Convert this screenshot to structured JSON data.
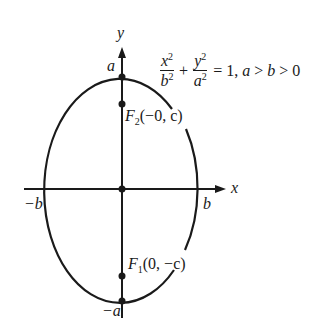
{
  "diagram": {
    "type": "ellipse-vertical-major-axis",
    "equation": {
      "term1_num": "x",
      "term1_den": "b",
      "term2_num": "y",
      "term2_den": "a",
      "exp": "2",
      "rhs": "= 1,",
      "condition_a": "a",
      "gt1": " > ",
      "condition_b": "b",
      "gt2": " > 0"
    },
    "axes": {
      "x_label": "x",
      "y_label": "y"
    },
    "vertices": {
      "top": "a",
      "bottom": "−a",
      "left": "−b",
      "right": "b"
    },
    "foci": [
      {
        "name": "F",
        "sub": "2",
        "coords": "(−0, c)"
      },
      {
        "name": "F",
        "sub": "1",
        "coords": "(0, −c)"
      }
    ],
    "colors": {
      "stroke": "#1a1a1a",
      "background": "#ffffff"
    }
  }
}
